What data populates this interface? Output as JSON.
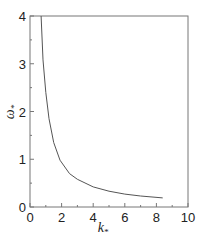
{
  "chart_data": {
    "type": "line",
    "title": "",
    "xlabel": "k*",
    "ylabel": "ω*",
    "xlim": [
      0,
      10
    ],
    "ylim": [
      0,
      4
    ],
    "xticks": [
      0,
      2,
      4,
      6,
      8,
      10
    ],
    "yticks": [
      0,
      1,
      2,
      3,
      4
    ],
    "grid": false,
    "legend": null,
    "series": [
      {
        "name": "dispersion curve",
        "color": "#555555",
        "x": [
          0.7,
          0.82,
          1.0,
          1.2,
          1.5,
          1.9,
          2.5,
          3.0,
          4.0,
          5.0,
          6.0,
          7.0,
          8.4
        ],
        "y": [
          4.0,
          3.08,
          2.4,
          1.85,
          1.35,
          0.98,
          0.7,
          0.58,
          0.42,
          0.33,
          0.27,
          0.23,
          0.19
        ]
      }
    ]
  }
}
